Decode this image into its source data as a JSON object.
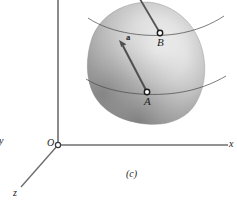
{
  "figure": {
    "caption": "(c)",
    "axes": {
      "origin_label": "O",
      "x_label": "x",
      "y_label": "y",
      "z_label": "z",
      "axis_color": "#6b6b6b"
    },
    "points": [
      {
        "id": "A",
        "label": "A",
        "x": 147,
        "y": 92
      },
      {
        "id": "B",
        "label": "B",
        "x": 160,
        "y": 33
      }
    ],
    "vector": {
      "label": "a",
      "from": "A",
      "to_x": 119,
      "to_y": 41,
      "color": "#555555"
    },
    "body": {
      "name": "rigid-body-blob",
      "fill_light": "#f0f0f0",
      "fill_mid": "#b8b8b8",
      "fill_dark": "#777777",
      "outline": "#8a8a8a"
    },
    "curves": [
      {
        "id": "upper-curve",
        "through": "B"
      },
      {
        "id": "lower-curve",
        "through": "A"
      }
    ]
  }
}
